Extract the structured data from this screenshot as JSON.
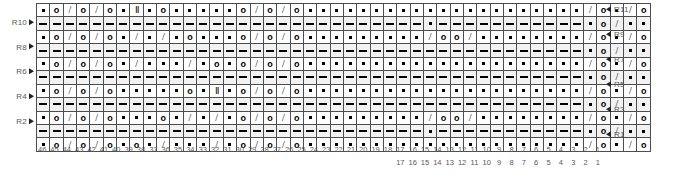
{
  "chart": {
    "columns": 46,
    "rows": 11,
    "symbol_legend": {
      "purl": "purl-dot",
      "yo": "yarn-over-o",
      "dec": "decrease-slash",
      "dash": "knit-on-ws-dash",
      "dbl": "double-roman-two",
      "none": "empty"
    },
    "row_labels_left": [
      "R10",
      "R8",
      "R6",
      "R4",
      "R2"
    ],
    "row_labels_right": [
      "R11",
      "R9",
      "R7",
      "R5",
      "R3",
      "R1"
    ],
    "colors": {
      "grid_line": "#4d4d4d",
      "symbol": "#000000",
      "label_text": "#58595b",
      "arrow": "#231f20",
      "ws_row_fill": "#f2f2f2",
      "background": "#ffffff"
    },
    "grid": [
      {
        "id": "R11",
        "side": "RS",
        "label": "R11",
        "label_side": "right",
        "cells": [
          "purl",
          "yo",
          "dec",
          "yo",
          "dec",
          "yo",
          "purl",
          "dbl",
          "purl",
          "yo",
          "purl",
          "purl",
          "purl",
          "purl",
          "purl",
          "yo",
          "dec",
          "yo",
          "dec",
          "yo",
          "purl",
          "purl",
          "purl",
          "purl",
          "purl",
          "purl",
          "purl",
          "purl",
          "purl",
          "purl",
          "purl",
          "purl",
          "purl",
          "purl",
          "purl",
          "purl",
          "purl",
          "purl",
          "purl",
          "purl",
          "purl",
          "dec",
          "yo",
          "purl",
          "dec",
          "yo"
        ]
      },
      {
        "id": "R10",
        "side": "WS",
        "label": "R10",
        "label_side": "left",
        "cells": [
          "dash",
          "dash",
          "dash",
          "dash",
          "dash",
          "dash",
          "dash",
          "dash",
          "dash",
          "dash",
          "dash",
          "dash",
          "dash",
          "dash",
          "dash",
          "dash",
          "dash",
          "dash",
          "dash",
          "dash",
          "dash",
          "dash",
          "dash",
          "dash",
          "dash",
          "dash",
          "dash",
          "dash",
          "dash",
          "purl",
          "dash",
          "dash",
          "dash",
          "dash",
          "dash",
          "dash",
          "dash",
          "dash",
          "dash",
          "dash",
          "dash",
          "purl",
          "yo",
          "dec",
          "purl",
          "purl"
        ]
      },
      {
        "id": "R9",
        "side": "RS",
        "label": "R9",
        "label_side": "right",
        "cells": [
          "purl",
          "yo",
          "dec",
          "yo",
          "dec",
          "yo",
          "purl",
          "dec",
          "purl",
          "dec",
          "purl",
          "yo",
          "purl",
          "purl",
          "purl",
          "yo",
          "dec",
          "yo",
          "dec",
          "yo",
          "purl",
          "purl",
          "purl",
          "purl",
          "purl",
          "purl",
          "purl",
          "purl",
          "purl",
          "dec",
          "yo",
          "yo",
          "dec",
          "purl",
          "purl",
          "purl",
          "purl",
          "purl",
          "purl",
          "purl",
          "purl",
          "dec",
          "yo",
          "purl",
          "dec",
          "yo"
        ]
      },
      {
        "id": "R8",
        "side": "WS",
        "label": "R8",
        "label_side": "left",
        "cells": [
          "dash",
          "dash",
          "dash",
          "dash",
          "dash",
          "dash",
          "dash",
          "dash",
          "dash",
          "dash",
          "dash",
          "dash",
          "dash",
          "dash",
          "dash",
          "dash",
          "dash",
          "dash",
          "dash",
          "dash",
          "dash",
          "dash",
          "dash",
          "dash",
          "dash",
          "dash",
          "dash",
          "dash",
          "dash",
          "dash",
          "dash",
          "dash",
          "dash",
          "dash",
          "dash",
          "dash",
          "dash",
          "dash",
          "dash",
          "dash",
          "dash",
          "purl",
          "yo",
          "dec",
          "purl",
          "purl"
        ]
      },
      {
        "id": "R7",
        "side": "RS",
        "label": "R7",
        "label_side": "right",
        "cells": [
          "purl",
          "yo",
          "dec",
          "yo",
          "dec",
          "yo",
          "purl",
          "dec",
          "purl",
          "purl",
          "purl",
          "dec",
          "purl",
          "yo",
          "purl",
          "yo",
          "dec",
          "yo",
          "dec",
          "yo",
          "purl",
          "purl",
          "purl",
          "purl",
          "purl",
          "purl",
          "purl",
          "purl",
          "purl",
          "purl",
          "purl",
          "purl",
          "purl",
          "purl",
          "purl",
          "purl",
          "purl",
          "purl",
          "purl",
          "purl",
          "purl",
          "dec",
          "yo",
          "purl",
          "dec",
          "yo"
        ]
      },
      {
        "id": "R6",
        "side": "WS",
        "label": "R6",
        "label_side": "left",
        "cells": [
          "dash",
          "dash",
          "dash",
          "dash",
          "dash",
          "dash",
          "dash",
          "dash",
          "dash",
          "dash",
          "dash",
          "dash",
          "dash",
          "dash",
          "dash",
          "dash",
          "dash",
          "dash",
          "dash",
          "dash",
          "dash",
          "dash",
          "dash",
          "dash",
          "dash",
          "dash",
          "dash",
          "dash",
          "dash",
          "dash",
          "dash",
          "dash",
          "dash",
          "dash",
          "dash",
          "dash",
          "dash",
          "dash",
          "dash",
          "dash",
          "dash",
          "purl",
          "yo",
          "dec",
          "purl",
          "purl"
        ]
      },
      {
        "id": "R5",
        "side": "RS",
        "label": "R5",
        "label_side": "right",
        "cells": [
          "purl",
          "yo",
          "dec",
          "yo",
          "dec",
          "yo",
          "purl",
          "purl",
          "purl",
          "purl",
          "purl",
          "yo",
          "purl",
          "dbl",
          "purl",
          "yo",
          "dec",
          "yo",
          "dec",
          "yo",
          "purl",
          "purl",
          "purl",
          "purl",
          "purl",
          "purl",
          "purl",
          "purl",
          "purl",
          "purl",
          "purl",
          "purl",
          "purl",
          "purl",
          "purl",
          "purl",
          "purl",
          "purl",
          "purl",
          "purl",
          "purl",
          "dec",
          "yo",
          "purl",
          "dec",
          "yo"
        ]
      },
      {
        "id": "R4",
        "side": "WS",
        "label": "R4",
        "label_side": "left",
        "cells": [
          "dash",
          "dash",
          "dash",
          "dash",
          "dash",
          "dash",
          "dash",
          "dash",
          "dash",
          "dash",
          "dash",
          "dash",
          "dash",
          "dash",
          "dash",
          "dash",
          "dash",
          "dash",
          "dash",
          "dash",
          "dash",
          "dash",
          "dash",
          "dash",
          "dash",
          "dash",
          "dash",
          "dash",
          "dash",
          "dash",
          "dash",
          "dash",
          "dash",
          "dash",
          "dash",
          "dash",
          "dash",
          "dash",
          "dash",
          "dash",
          "dash",
          "purl",
          "yo",
          "dec",
          "purl",
          "purl"
        ]
      },
      {
        "id": "R3",
        "side": "RS",
        "label": "R3",
        "label_side": "right",
        "cells": [
          "purl",
          "yo",
          "dec",
          "yo",
          "dec",
          "yo",
          "purl",
          "purl",
          "purl",
          "yo",
          "purl",
          "dec",
          "purl",
          "dec",
          "purl",
          "yo",
          "dec",
          "yo",
          "dec",
          "yo",
          "purl",
          "purl",
          "purl",
          "purl",
          "purl",
          "purl",
          "purl",
          "purl",
          "purl",
          "dec",
          "yo",
          "yo",
          "dec",
          "purl",
          "purl",
          "purl",
          "purl",
          "purl",
          "purl",
          "purl",
          "purl",
          "dec",
          "yo",
          "purl",
          "dec",
          "yo"
        ]
      },
      {
        "id": "R2",
        "side": "WS",
        "label": "R2",
        "label_side": "left",
        "cells": [
          "dash",
          "dash",
          "dash",
          "dash",
          "dash",
          "dash",
          "dash",
          "dash",
          "dash",
          "dash",
          "dash",
          "dash",
          "dash",
          "dash",
          "dash",
          "dash",
          "dash",
          "dash",
          "dash",
          "dash",
          "dash",
          "dash",
          "dash",
          "dash",
          "dash",
          "dash",
          "dash",
          "dash",
          "dash",
          "purl",
          "dash",
          "dash",
          "dash",
          "dash",
          "dash",
          "dash",
          "dash",
          "dash",
          "dash",
          "dash",
          "dash",
          "purl",
          "yo",
          "dec",
          "purl",
          "purl"
        ]
      },
      {
        "id": "R1",
        "side": "RS",
        "label": "R1",
        "label_side": "right",
        "cells": [
          "purl",
          "yo",
          "dec",
          "yo",
          "dec",
          "yo",
          "purl",
          "yo",
          "purl",
          "dec",
          "purl",
          "purl",
          "purl",
          "dec",
          "purl",
          "yo",
          "dec",
          "yo",
          "dec",
          "yo",
          "purl",
          "purl",
          "purl",
          "purl",
          "purl",
          "purl",
          "purl",
          "purl",
          "purl",
          "purl",
          "purl",
          "purl",
          "purl",
          "purl",
          "purl",
          "purl",
          "purl",
          "purl",
          "purl",
          "purl",
          "purl",
          "dec",
          "yo",
          "purl",
          "dec",
          "yo"
        ]
      }
    ],
    "axis_primary": [
      46,
      45,
      44,
      43,
      42,
      41,
      40,
      39,
      38,
      37,
      36,
      35,
      34,
      33,
      32,
      31,
      30,
      29,
      28,
      27,
      26,
      25,
      24,
      23,
      22,
      21,
      20,
      19,
      18,
      17,
      16,
      15,
      14,
      13,
      12,
      11,
      10,
      9,
      8,
      7,
      6,
      5,
      4,
      3,
      2,
      1
    ],
    "axis_secondary": {
      "start_column_index": 29,
      "values": [
        17,
        16,
        15,
        14,
        13,
        12,
        11,
        10,
        9,
        8,
        7,
        6,
        5,
        4,
        3,
        2,
        1
      ]
    }
  }
}
